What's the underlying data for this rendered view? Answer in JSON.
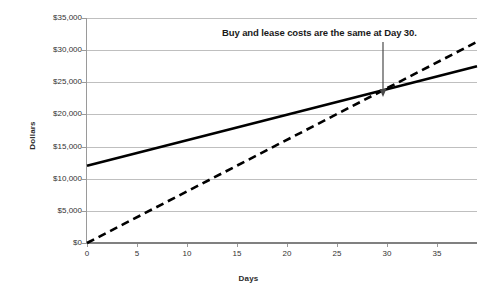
{
  "chart_data": {
    "type": "line",
    "title": "",
    "xlabel": "Days",
    "ylabel": "Dollars",
    "xlim": [
      0,
      39
    ],
    "ylim": [
      0,
      35000
    ],
    "grid": true,
    "legend": "none",
    "x_ticks": [
      "0",
      "5",
      "10",
      "15",
      "20",
      "25",
      "30",
      "35"
    ],
    "x_tick_values": [
      0,
      5,
      10,
      15,
      20,
      25,
      30,
      35
    ],
    "y_ticks": [
      "$0",
      "$5,000",
      "$10,000",
      "$15,000",
      "$20,000",
      "$25,000",
      "$30,000",
      "$35,000"
    ],
    "y_tick_values": [
      0,
      5000,
      10000,
      15000,
      20000,
      25000,
      30000,
      35000
    ],
    "x": [
      0,
      39
    ],
    "series": [
      {
        "name": "Buy",
        "style": "solid",
        "color": "#000000",
        "values": [
          12000,
          27500
        ]
      },
      {
        "name": "Lease",
        "style": "dashed",
        "color": "#000000",
        "values": [
          0,
          31300
        ]
      }
    ],
    "annotations": [
      {
        "text": "Buy and lease costs are the same at Day 30.",
        "arrow": "down",
        "target_x": 30,
        "target_y": 24000
      }
    ],
    "intersection": {
      "day": 30,
      "dollars": 24000
    }
  }
}
